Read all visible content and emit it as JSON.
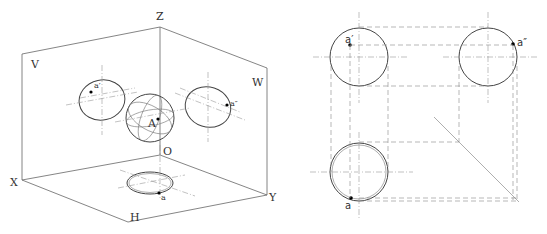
{
  "left_diagram": {
    "axes": {
      "z": "Z",
      "x": "X",
      "y": "Y",
      "origin": "O"
    },
    "planes": {
      "v": "V",
      "w": "W",
      "h": "H"
    },
    "points": {
      "space": "A",
      "front": "a′",
      "side": "a″",
      "top": "a"
    }
  },
  "right_diagram": {
    "points": {
      "front": "a′",
      "side": "a″",
      "top": "a"
    }
  }
}
